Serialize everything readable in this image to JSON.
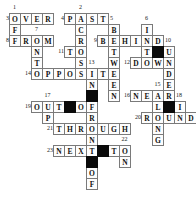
{
  "puzzle": {
    "kind": "crossword",
    "grid": {
      "cols": 17,
      "rows": 16,
      "cell_w": 11,
      "cell_h": 11,
      "origin_x": 9,
      "origin_y": 13
    },
    "colors": {
      "cell_border": "#7a7a7a",
      "cell_bg": "#fdfdfd",
      "black_cell": "#0a0a0a",
      "letter": "#111111",
      "number": "#1a1a1a"
    },
    "cells": [
      {
        "r": 1,
        "c": 1,
        "ch": "O"
      },
      {
        "r": 1,
        "c": 2,
        "ch": "V"
      },
      {
        "r": 1,
        "c": 3,
        "ch": "E"
      },
      {
        "r": 1,
        "c": 4,
        "ch": "R"
      },
      {
        "r": 1,
        "c": 6,
        "ch": "P"
      },
      {
        "r": 1,
        "c": 7,
        "ch": "A"
      },
      {
        "r": 1,
        "c": 8,
        "ch": "S"
      },
      {
        "r": 1,
        "c": 9,
        "ch": "T"
      },
      {
        "r": 2,
        "c": 1,
        "ch": "F"
      },
      {
        "r": 2,
        "c": 7,
        "ch": "C"
      },
      {
        "r": 2,
        "c": 10,
        "ch": "B"
      },
      {
        "r": 2,
        "c": 13,
        "ch": "I"
      },
      {
        "r": 3,
        "c": 1,
        "ch": "F"
      },
      {
        "r": 3,
        "c": 2,
        "ch": "R"
      },
      {
        "r": 3,
        "c": 3,
        "ch": "O"
      },
      {
        "r": 3,
        "c": 4,
        "ch": "M"
      },
      {
        "r": 3,
        "c": 7,
        "ch": "R"
      },
      {
        "r": 3,
        "c": 9,
        "ch": "B"
      },
      {
        "r": 3,
        "c": 10,
        "ch": "E"
      },
      {
        "r": 3,
        "c": 11,
        "ch": "H"
      },
      {
        "r": 3,
        "c": 12,
        "ch": "I"
      },
      {
        "r": 3,
        "c": 13,
        "ch": "N"
      },
      {
        "r": 3,
        "c": 14,
        "ch": "D"
      },
      {
        "r": 4,
        "c": 3,
        "ch": "N"
      },
      {
        "r": 4,
        "c": 6,
        "ch": "T"
      },
      {
        "r": 4,
        "c": 7,
        "ch": "O"
      },
      {
        "r": 4,
        "c": 10,
        "ch": "T"
      },
      {
        "r": 4,
        "c": 13,
        "ch": "T"
      },
      {
        "r": 4,
        "c": 15,
        "ch": "U"
      },
      {
        "r": 5,
        "c": 3,
        "ch": "T"
      },
      {
        "r": 5,
        "c": 7,
        "ch": "S"
      },
      {
        "r": 5,
        "c": 10,
        "ch": "W"
      },
      {
        "r": 5,
        "c": 12,
        "ch": "D"
      },
      {
        "r": 5,
        "c": 13,
        "ch": "O"
      },
      {
        "r": 5,
        "c": 14,
        "ch": "W"
      },
      {
        "r": 5,
        "c": 15,
        "ch": "N"
      },
      {
        "r": 6,
        "c": 3,
        "ch": "O"
      },
      {
        "r": 6,
        "c": 4,
        "ch": "P"
      },
      {
        "r": 6,
        "c": 5,
        "ch": "P"
      },
      {
        "r": 6,
        "c": 6,
        "ch": "O"
      },
      {
        "r": 6,
        "c": 7,
        "ch": "S"
      },
      {
        "r": 6,
        "c": 8,
        "ch": "I"
      },
      {
        "r": 6,
        "c": 9,
        "ch": "T"
      },
      {
        "r": 6,
        "c": 10,
        "ch": "E"
      },
      {
        "r": 6,
        "c": 15,
        "ch": "D"
      },
      {
        "r": 7,
        "c": 8,
        "ch": "N"
      },
      {
        "r": 7,
        "c": 10,
        "ch": "E"
      },
      {
        "r": 7,
        "c": 15,
        "ch": "E"
      },
      {
        "r": 8,
        "c": 10,
        "ch": "N"
      },
      {
        "r": 8,
        "c": 12,
        "ch": "N"
      },
      {
        "r": 8,
        "c": 13,
        "ch": "E"
      },
      {
        "r": 8,
        "c": 14,
        "ch": "A"
      },
      {
        "r": 8,
        "c": 15,
        "ch": "R"
      },
      {
        "r": 9,
        "c": 3,
        "ch": "O"
      },
      {
        "r": 9,
        "c": 4,
        "ch": "U"
      },
      {
        "r": 9,
        "c": 5,
        "ch": "T"
      },
      {
        "r": 9,
        "c": 7,
        "ch": "O"
      },
      {
        "r": 9,
        "c": 8,
        "ch": "F"
      },
      {
        "r": 9,
        "c": 14,
        "ch": "L"
      },
      {
        "r": 9,
        "c": 16,
        "ch": "I"
      },
      {
        "r": 10,
        "c": 4,
        "ch": "P"
      },
      {
        "r": 10,
        "c": 8,
        "ch": "R"
      },
      {
        "r": 10,
        "c": 13,
        "ch": "R"
      },
      {
        "r": 10,
        "c": 14,
        "ch": "O"
      },
      {
        "r": 10,
        "c": 15,
        "ch": "U"
      },
      {
        "r": 10,
        "c": 16,
        "ch": "N"
      },
      {
        "r": 10,
        "c": 17,
        "ch": "D"
      },
      {
        "r": 11,
        "c": 5,
        "ch": "T"
      },
      {
        "r": 11,
        "c": 6,
        "ch": "H"
      },
      {
        "r": 11,
        "c": 7,
        "ch": "R"
      },
      {
        "r": 11,
        "c": 8,
        "ch": "O"
      },
      {
        "r": 11,
        "c": 9,
        "ch": "U"
      },
      {
        "r": 11,
        "c": 10,
        "ch": "G"
      },
      {
        "r": 11,
        "c": 11,
        "ch": "H"
      },
      {
        "r": 11,
        "c": 14,
        "ch": "N"
      },
      {
        "r": 12,
        "c": 8,
        "ch": "N"
      },
      {
        "r": 12,
        "c": 14,
        "ch": "G"
      },
      {
        "r": 13,
        "c": 5,
        "ch": "N"
      },
      {
        "r": 13,
        "c": 6,
        "ch": "E"
      },
      {
        "r": 13,
        "c": 7,
        "ch": "X"
      },
      {
        "r": 13,
        "c": 8,
        "ch": "T"
      },
      {
        "r": 13,
        "c": 10,
        "ch": "T"
      },
      {
        "r": 13,
        "c": 11,
        "ch": "O"
      },
      {
        "r": 14,
        "c": 11,
        "ch": "N"
      },
      {
        "r": 15,
        "c": 8,
        "ch": "O"
      },
      {
        "r": 16,
        "c": 8,
        "ch": "F"
      }
    ],
    "black_cells": [
      {
        "r": 4,
        "c": 14
      },
      {
        "r": 8,
        "c": 8
      },
      {
        "r": 9,
        "c": 6
      },
      {
        "r": 9,
        "c": 15
      },
      {
        "r": 13,
        "c": 9
      },
      {
        "r": 14,
        "c": 8
      }
    ],
    "numbers": [
      {
        "n": "1",
        "r": 0,
        "c": 1,
        "a": "center"
      },
      {
        "n": "2",
        "r": 0,
        "c": 7,
        "a": "center"
      },
      {
        "n": "3",
        "r": 1,
        "c": 0,
        "a": "left"
      },
      {
        "n": "4",
        "r": 1,
        "c": 5,
        "a": "left"
      },
      {
        "n": "5",
        "r": 1,
        "c": 10,
        "a": "right"
      },
      {
        "n": "6",
        "r": 1,
        "c": 13,
        "a": "center"
      },
      {
        "n": "7",
        "r": 2,
        "c": 3,
        "a": "center"
      },
      {
        "n": "8",
        "r": 3,
        "c": 0,
        "a": "left"
      },
      {
        "n": "9",
        "r": 3,
        "c": 8,
        "a": "left"
      },
      {
        "n": "10",
        "r": 3,
        "c": 15,
        "a": "right"
      },
      {
        "n": "11",
        "r": 4,
        "c": 5,
        "a": "left"
      },
      {
        "n": "12",
        "r": 5,
        "c": 11,
        "a": "left"
      },
      {
        "n": "13",
        "r": 5,
        "c": 8,
        "a": "center"
      },
      {
        "n": "14",
        "r": 6,
        "c": 2,
        "a": "left"
      },
      {
        "n": "15",
        "r": 7,
        "c": 14,
        "a": "center"
      },
      {
        "n": "16",
        "r": 8,
        "c": 11,
        "a": "left"
      },
      {
        "n": "17",
        "r": 8,
        "c": 4,
        "a": "center"
      },
      {
        "n": "18",
        "r": 8,
        "c": 16,
        "a": "right"
      },
      {
        "n": "19",
        "r": 9,
        "c": 2,
        "a": "left"
      },
      {
        "n": "20",
        "r": 10,
        "c": 12,
        "a": "left"
      },
      {
        "n": "21",
        "r": 11,
        "c": 4,
        "a": "left"
      },
      {
        "n": "22",
        "r": 12,
        "c": 11,
        "a": "center"
      },
      {
        "n": "23",
        "r": 13,
        "c": 4,
        "a": "left"
      }
    ],
    "answers": {
      "across": [
        {
          "num": "3",
          "word": "OVER"
        },
        {
          "num": "4",
          "word": "PAST"
        },
        {
          "num": "8",
          "word": "FROM"
        },
        {
          "num": "9",
          "word": "BEHIND"
        },
        {
          "num": "11",
          "word": "TO"
        },
        {
          "num": "12",
          "word": "DOWN"
        },
        {
          "num": "14",
          "word": "OPPOSITE"
        },
        {
          "num": "16",
          "word": "NEAR"
        },
        {
          "num": "19",
          "word": "OUT OF"
        },
        {
          "num": "20",
          "word": "ROUND"
        },
        {
          "num": "21",
          "word": "THROUGH"
        },
        {
          "num": "23",
          "word": "NEXT TO"
        }
      ],
      "down": [
        {
          "num": "1",
          "word": "OFF"
        },
        {
          "num": "2",
          "word": "ACROSS"
        },
        {
          "num": "5",
          "word": "BETWEEN"
        },
        {
          "num": "6",
          "word": "INTO"
        },
        {
          "num": "7",
          "word": "ONTO"
        },
        {
          "num": "10",
          "word": "UNDER"
        },
        {
          "num": "13",
          "word": "IN FRONT OF"
        },
        {
          "num": "15",
          "word": "ALONG"
        },
        {
          "num": "17",
          "word": "UP"
        },
        {
          "num": "18",
          "word": "IN"
        },
        {
          "num": "22",
          "word": "ON"
        }
      ]
    }
  }
}
